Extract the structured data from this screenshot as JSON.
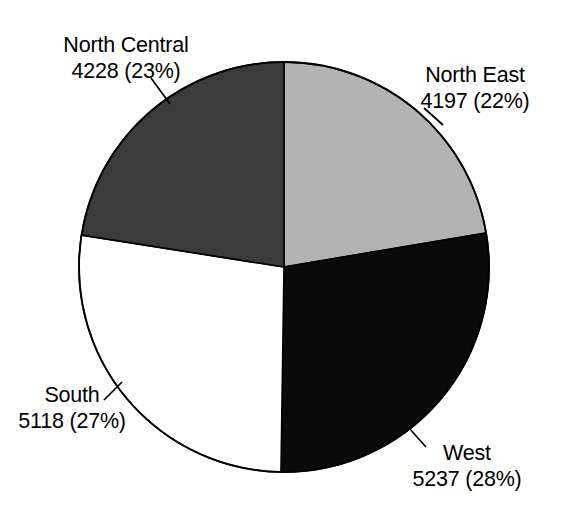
{
  "chart_data": {
    "type": "pie",
    "title": "",
    "subtitle": "",
    "xlabel": "",
    "ylabel": "",
    "legend_position": "none",
    "grid": false,
    "total": 18780,
    "start_angle_deg": 0,
    "direction": "clockwise",
    "center": {
      "x": 284,
      "y": 267
    },
    "radius": 205,
    "categories": [
      "North East",
      "West",
      "South",
      "North Central"
    ],
    "values": [
      4197,
      5237,
      5118,
      4228
    ],
    "percent_labels": [
      "22%",
      "28%",
      "27%",
      "23%"
    ],
    "slices": [
      {
        "label": "North East",
        "value": 4197,
        "value_text": "4197",
        "percent_text": "22%",
        "annotation": "4197 (22%)",
        "color": "#b3b3b3",
        "start_deg": 0.0,
        "end_deg": 80.45
      },
      {
        "label": "West",
        "value": 5237,
        "value_text": "5237",
        "percent_text": "28%",
        "annotation": "5237 (28%)",
        "color": "#0a0a0a",
        "start_deg": 80.45,
        "end_deg": 180.85
      },
      {
        "label": "South",
        "value": 5118,
        "value_text": "5118",
        "percent_text": "27%",
        "annotation": "5118 (27%)",
        "color": "#ffffff",
        "start_deg": 180.85,
        "end_deg": 278.95
      },
      {
        "label": "North Central",
        "value": 4228,
        "value_text": "4228",
        "percent_text": "23%",
        "annotation": "4228 (23%)",
        "color": "#3b3b3b",
        "start_deg": 278.95,
        "end_deg": 360.0
      }
    ]
  },
  "labels": {
    "north_central": {
      "name": "North Central",
      "value": "4228 (23%)"
    },
    "north_east": {
      "name": "North East",
      "value": "4197 (22%)"
    },
    "south": {
      "name": "South",
      "value": "5118 (27%)"
    },
    "west": {
      "name": "West",
      "value": "5237 (28%)"
    }
  },
  "style": {
    "outline_color": "#000000",
    "background": "#ffffff",
    "leader_color": "#000000"
  }
}
